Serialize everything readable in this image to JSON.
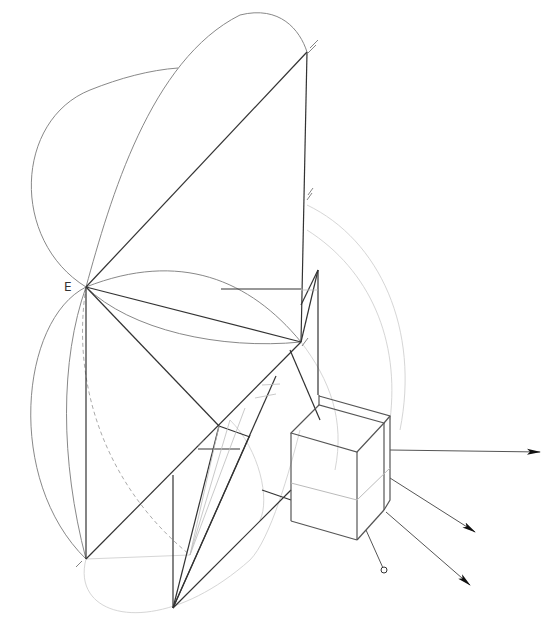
{
  "diagram": {
    "title": "",
    "labels": [
      {
        "id": "point-e",
        "text": "E",
        "x": 64,
        "y": 280
      }
    ],
    "colors": {
      "background": "#ffffff",
      "main_line": "#333333",
      "secondary_line": "#777777",
      "construction_line": "#cccccc",
      "arrow": "#111111"
    },
    "key_points": {
      "E": [
        86,
        287
      ],
      "top_vertex": [
        307,
        52
      ],
      "right_vertex": [
        301,
        342
      ],
      "bottom_left_vertex": [
        86,
        559
      ],
      "mid_vertex": [
        219,
        426
      ],
      "bottom_vertex": [
        173,
        608
      ]
    },
    "cube": {
      "top_front_left": [
        291,
        433
      ],
      "top_front_right": [
        357,
        452
      ],
      "top_back_right": [
        384,
        423
      ],
      "top_back_left": [
        319,
        405
      ],
      "bottom_front_left": [
        291,
        521
      ],
      "bottom_front_right": [
        357,
        540
      ],
      "bottom_back_right": [
        384,
        510
      ]
    },
    "arrows": [
      {
        "from": [
          390,
          450
        ],
        "to": [
          540,
          452
        ],
        "head": "filled"
      },
      {
        "from": [
          390,
          478
        ],
        "to": [
          475,
          532
        ],
        "head": "filled"
      },
      {
        "from": [
          386,
          512
        ],
        "to": [
          470,
          585
        ],
        "head": "filled"
      },
      {
        "from": [
          366,
          530
        ],
        "to": [
          384,
          572
        ],
        "head": "open-circle"
      }
    ]
  }
}
